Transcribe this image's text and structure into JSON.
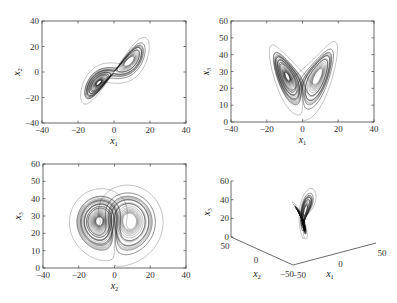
{
  "chart_data": [
    {
      "type": "line",
      "panel": "top-left",
      "title": "",
      "description": "Lorenz attractor projection onto x1-x2 plane",
      "xlabel": "x1",
      "ylabel": "x2",
      "xlim": [
        -40,
        40
      ],
      "ylim": [
        -40,
        40
      ],
      "xticks": [
        -40,
        -20,
        0,
        20,
        40
      ],
      "yticks": [
        -40,
        -20,
        0,
        20,
        40
      ],
      "x_var": "x1",
      "y_var": "x2",
      "grid": false,
      "box": {
        "left": 42,
        "top": 21,
        "right": 186,
        "bottom": 123
      }
    },
    {
      "type": "line",
      "panel": "top-right",
      "title": "",
      "description": "Lorenz attractor projection onto x1-x3 plane",
      "xlabel": "x1",
      "ylabel": "x3",
      "xlim": [
        -40,
        40
      ],
      "ylim": [
        0,
        60
      ],
      "xticks": [
        -40,
        -20,
        0,
        20,
        40
      ],
      "yticks": [
        0,
        10,
        20,
        30,
        40,
        50,
        60
      ],
      "x_var": "x1",
      "y_var": "x3",
      "grid": false,
      "box": {
        "left": 231,
        "top": 21,
        "right": 374,
        "bottom": 122
      }
    },
    {
      "type": "line",
      "panel": "bottom-left",
      "title": "",
      "description": "Lorenz attractor projection onto x2-x3 plane",
      "xlabel": "x2",
      "ylabel": "x3",
      "xlim": [
        -40,
        40
      ],
      "ylim": [
        0,
        60
      ],
      "xticks": [
        -40,
        -20,
        0,
        20,
        40
      ],
      "yticks": [
        0,
        10,
        20,
        30,
        40,
        50,
        60
      ],
      "x_var": "x2",
      "y_var": "x3",
      "grid": false,
      "box": {
        "left": 43,
        "top": 164,
        "right": 186,
        "bottom": 268
      }
    },
    {
      "type": "line3d",
      "panel": "bottom-right",
      "title": "",
      "description": "Lorenz attractor in 3D (x1, x2, x3)",
      "xlabel": "x1",
      "ylabel": "x2",
      "zlabel": "x3",
      "xlim": [
        -50,
        50
      ],
      "ylim": [
        -50,
        50
      ],
      "zlim": [
        0,
        60
      ],
      "xticks": [
        -50,
        0,
        50
      ],
      "yticks": [
        -50,
        0,
        50
      ],
      "zticks": [
        0,
        20,
        40,
        60
      ],
      "grid": false
    }
  ],
  "system": {
    "name": "Lorenz",
    "sigma": 10,
    "rho": 28,
    "beta": 2.6667,
    "initial": [
      0.1,
      0.0,
      2.0
    ],
    "dt": 0.005,
    "steps": 9000
  },
  "labels": {
    "x1": "x",
    "x1_sub": "1",
    "x2": "x",
    "x2_sub": "2",
    "x3": "x",
    "x3_sub": "3"
  },
  "colors": {
    "line": "#1a1a1a",
    "axis": "#444444",
    "background": "#ffffff"
  }
}
